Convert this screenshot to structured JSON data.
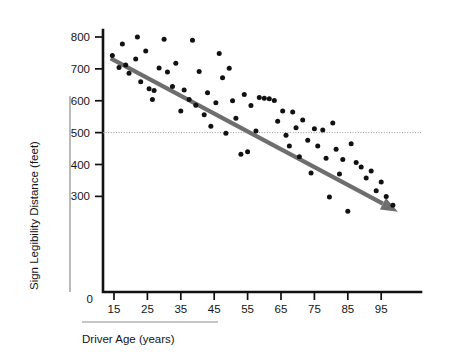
{
  "chart_data": {
    "type": "scatter",
    "title": "",
    "xlabel": "Driver Age (years)",
    "ylabel": "Sign Legibility Distance (feet)",
    "xlim": [
      10,
      102
    ],
    "ylim": [
      230,
      830
    ],
    "x_ticks": [
      15,
      25,
      35,
      45,
      55,
      65,
      75,
      85,
      95
    ],
    "y_ticks": [
      0,
      300,
      400,
      500,
      600,
      700,
      800
    ],
    "y_origin_label": "0",
    "grid": false,
    "legend": "none",
    "reference_lines": [
      {
        "name": "y-500-dotted",
        "axis": "y",
        "value": 500,
        "style": "dotted",
        "color": "#9a9a9a"
      }
    ],
    "trend_line": {
      "name": "regression-line",
      "style": "solid-arrow",
      "color": "#6e6e6e",
      "x_start": 14,
      "y_start": 733,
      "x_end": 100,
      "y_end": 252
    },
    "point_color": "#111111",
    "points": [
      {
        "x": 14.5,
        "y": 742
      },
      {
        "x": 16.5,
        "y": 704
      },
      {
        "x": 17.5,
        "y": 778
      },
      {
        "x": 18.5,
        "y": 712
      },
      {
        "x": 19.5,
        "y": 686
      },
      {
        "x": 21.5,
        "y": 731
      },
      {
        "x": 22.0,
        "y": 800
      },
      {
        "x": 23.0,
        "y": 660
      },
      {
        "x": 24.5,
        "y": 756
      },
      {
        "x": 25.5,
        "y": 638
      },
      {
        "x": 26.5,
        "y": 604
      },
      {
        "x": 27.0,
        "y": 632
      },
      {
        "x": 28.5,
        "y": 703
      },
      {
        "x": 30.0,
        "y": 793
      },
      {
        "x": 31.0,
        "y": 690
      },
      {
        "x": 32.5,
        "y": 645
      },
      {
        "x": 33.5,
        "y": 718
      },
      {
        "x": 35.0,
        "y": 568
      },
      {
        "x": 36.0,
        "y": 634
      },
      {
        "x": 37.5,
        "y": 604
      },
      {
        "x": 38.5,
        "y": 790
      },
      {
        "x": 39.5,
        "y": 586
      },
      {
        "x": 40.5,
        "y": 692
      },
      {
        "x": 42.0,
        "y": 556
      },
      {
        "x": 43.0,
        "y": 625
      },
      {
        "x": 44.0,
        "y": 520
      },
      {
        "x": 45.5,
        "y": 594
      },
      {
        "x": 46.5,
        "y": 748
      },
      {
        "x": 47.5,
        "y": 672
      },
      {
        "x": 48.5,
        "y": 498
      },
      {
        "x": 49.5,
        "y": 702
      },
      {
        "x": 50.5,
        "y": 600
      },
      {
        "x": 51.5,
        "y": 545
      },
      {
        "x": 53.0,
        "y": 432
      },
      {
        "x": 54.0,
        "y": 620
      },
      {
        "x": 55.0,
        "y": 440
      },
      {
        "x": 56.0,
        "y": 585
      },
      {
        "x": 57.5,
        "y": 505
      },
      {
        "x": 58.5,
        "y": 610
      },
      {
        "x": 60.0,
        "y": 608
      },
      {
        "x": 61.5,
        "y": 606
      },
      {
        "x": 63.0,
        "y": 601
      },
      {
        "x": 64.0,
        "y": 536
      },
      {
        "x": 65.5,
        "y": 568
      },
      {
        "x": 66.5,
        "y": 492
      },
      {
        "x": 67.5,
        "y": 458
      },
      {
        "x": 68.5,
        "y": 565
      },
      {
        "x": 69.5,
        "y": 515
      },
      {
        "x": 70.5,
        "y": 424
      },
      {
        "x": 71.5,
        "y": 540
      },
      {
        "x": 73.0,
        "y": 476
      },
      {
        "x": 74.0,
        "y": 373
      },
      {
        "x": 75.0,
        "y": 512
      },
      {
        "x": 76.0,
        "y": 458
      },
      {
        "x": 77.5,
        "y": 508
      },
      {
        "x": 78.5,
        "y": 420
      },
      {
        "x": 79.5,
        "y": 298
      },
      {
        "x": 80.5,
        "y": 530
      },
      {
        "x": 81.5,
        "y": 448
      },
      {
        "x": 82.5,
        "y": 370
      },
      {
        "x": 83.5,
        "y": 416
      },
      {
        "x": 85.0,
        "y": 253
      },
      {
        "x": 86.0,
        "y": 465
      },
      {
        "x": 87.5,
        "y": 406
      },
      {
        "x": 89.0,
        "y": 392
      },
      {
        "x": 90.5,
        "y": 358
      },
      {
        "x": 92.0,
        "y": 380
      },
      {
        "x": 93.5,
        "y": 318
      },
      {
        "x": 95.0,
        "y": 345
      },
      {
        "x": 96.5,
        "y": 300
      },
      {
        "x": 98.5,
        "y": 272
      }
    ]
  }
}
